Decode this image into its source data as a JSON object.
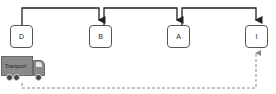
{
  "diagram": {
    "nodes": [
      {
        "id": "D",
        "label": "D",
        "x": 10,
        "y": 25
      },
      {
        "id": "B",
        "label": "B",
        "x": 89,
        "y": 25
      },
      {
        "id": "A",
        "label": "A",
        "x": 167,
        "y": 25
      },
      {
        "id": "I",
        "label": "I",
        "x": 245,
        "y": 25
      }
    ],
    "edges": [
      {
        "from": "D",
        "to": "B",
        "style": "solid"
      },
      {
        "from": "B",
        "to": "A",
        "style": "solid"
      },
      {
        "from": "A",
        "to": "I",
        "style": "solid"
      },
      {
        "from": "Transport",
        "to": "I",
        "style": "dashed"
      }
    ],
    "vehicle": {
      "label": "Transport",
      "icon": "truck-icon"
    },
    "colors": {
      "line": "#222222",
      "dashed": "#777777",
      "truck": "#8a8a8a",
      "node_border": "#555555"
    }
  }
}
